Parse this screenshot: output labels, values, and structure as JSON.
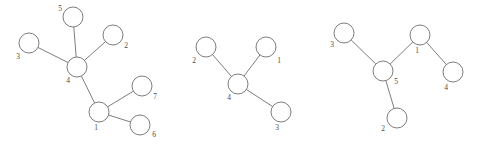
{
  "figure": {
    "background_color": "#ffffff",
    "node_stroke_color": "#6e6e6e",
    "node_fill_color": "#ffffff",
    "edge_color": "#6e6e6e",
    "label_color": "#4a4a4a",
    "width": 484,
    "height": 145
  },
  "graphs": [
    {
      "name": "graph-left",
      "node_count": 7,
      "nodes": [
        {
          "label": "5",
          "cx": 73,
          "cy": 17,
          "r": 10,
          "lx": 60,
          "ly": 9
        },
        {
          "label": "2",
          "cx": 113,
          "cy": 35,
          "r": 10,
          "lx": 126,
          "ly": 46
        },
        {
          "label": "3",
          "cx": 29,
          "cy": 43,
          "r": 10,
          "lx": 18,
          "ly": 57
        },
        {
          "label": "4",
          "cx": 77,
          "cy": 67,
          "r": 10,
          "lx": 68,
          "ly": 81
        },
        {
          "label": "7",
          "cx": 142,
          "cy": 86,
          "r": 10,
          "lx": 155,
          "ly": 97
        },
        {
          "label": "1",
          "cx": 99,
          "cy": 112,
          "r": 10,
          "lx": 96,
          "ly": 128
        },
        {
          "label": "6",
          "cx": 140,
          "cy": 125,
          "r": 10,
          "lx": 154,
          "ly": 135
        }
      ],
      "edges": [
        {
          "from": "5",
          "to": "4"
        },
        {
          "from": "2",
          "to": "4"
        },
        {
          "from": "3",
          "to": "4"
        },
        {
          "from": "4",
          "to": "1"
        },
        {
          "from": "1",
          "to": "7"
        },
        {
          "from": "1",
          "to": "6"
        }
      ]
    },
    {
      "name": "graph-middle",
      "node_count": 4,
      "nodes": [
        {
          "label": "2",
          "cx": 206,
          "cy": 47,
          "r": 10,
          "lx": 194,
          "ly": 61
        },
        {
          "label": "1",
          "cx": 266,
          "cy": 47,
          "r": 10,
          "lx": 279,
          "ly": 61
        },
        {
          "label": "4",
          "cx": 238,
          "cy": 84,
          "r": 10,
          "lx": 229,
          "ly": 98
        },
        {
          "label": "3",
          "cx": 281,
          "cy": 112,
          "r": 10,
          "lx": 277,
          "ly": 128
        }
      ],
      "edges": [
        {
          "from": "2",
          "to": "4"
        },
        {
          "from": "1",
          "to": "4"
        },
        {
          "from": "4",
          "to": "3"
        }
      ]
    },
    {
      "name": "graph-right",
      "node_count": 5,
      "nodes": [
        {
          "label": "3",
          "cx": 344,
          "cy": 33,
          "r": 10,
          "lx": 332,
          "ly": 45
        },
        {
          "label": "1",
          "cx": 420,
          "cy": 35,
          "r": 10,
          "lx": 417,
          "ly": 51
        },
        {
          "label": "5",
          "cx": 383,
          "cy": 71,
          "r": 10,
          "lx": 396,
          "ly": 82
        },
        {
          "label": "4",
          "cx": 453,
          "cy": 72,
          "r": 10,
          "lx": 446,
          "ly": 88
        },
        {
          "label": "2",
          "cx": 397,
          "cy": 118,
          "r": 10,
          "lx": 383,
          "ly": 129
        }
      ],
      "edges": [
        {
          "from": "3",
          "to": "5"
        },
        {
          "from": "1",
          "to": "5"
        },
        {
          "from": "1",
          "to": "4"
        },
        {
          "from": "5",
          "to": "2"
        }
      ]
    }
  ]
}
